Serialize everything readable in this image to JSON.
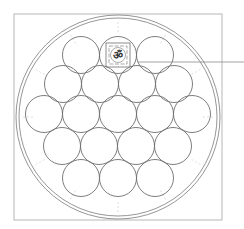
{
  "diagram": {
    "title": "",
    "colors": {
      "background": "#ffffff",
      "frame": "#b0b0b0",
      "outer_ring": "#8a8a8a",
      "circle": "#6e6e6e",
      "ticks": "#d0d0d0",
      "leader": "#8a8a8a",
      "symbol": "#333333"
    },
    "frame": {
      "x": 14,
      "y": 14,
      "w": 208,
      "h": 206
    },
    "outer_circle": {
      "cx": 118,
      "cy": 117,
      "r_outer": 102,
      "r_inner": 99
    },
    "small_circle_radius": 18.5,
    "rows": [
      {
        "cy": 55,
        "cx": [
          81,
          118,
          155
        ]
      },
      {
        "cy": 84,
        "cx": [
          63,
          100,
          137,
          174
        ]
      },
      {
        "cy": 114,
        "cx": [
          44,
          81,
          118,
          155,
          192
        ]
      },
      {
        "cy": 146,
        "cx": [
          62,
          99,
          136,
          173
        ]
      },
      {
        "cy": 178,
        "cx": [
          81,
          118,
          155
        ]
      }
    ],
    "highlight": {
      "row": 0,
      "index": 1,
      "symbol": "ॐ",
      "symbol_name": "om-symbol",
      "border": "meander-square"
    },
    "leader_line": {
      "x1": 138,
      "y1": 62,
      "x2": 244,
      "y2": 62
    },
    "circle_count": "19"
  }
}
